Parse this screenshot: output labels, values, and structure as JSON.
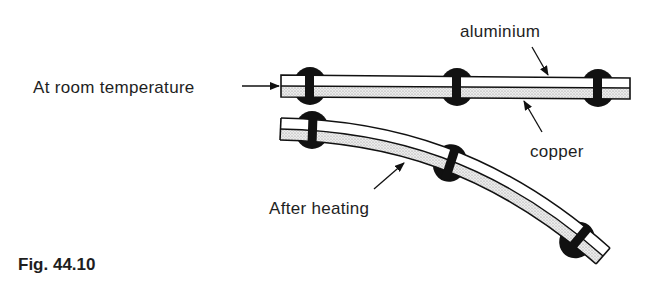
{
  "figure": {
    "caption": "Fig. 44.10",
    "labels": {
      "room_temperature": "At room temperature",
      "aluminium": "aluminium",
      "copper": "copper",
      "after_heating": "After heating"
    }
  },
  "diagram": {
    "states": [
      {
        "name": "At room temperature",
        "shape": "straight",
        "rivets": 3
      },
      {
        "name": "After heating",
        "shape": "bent downward",
        "rivets": 3
      }
    ],
    "layers": [
      {
        "material": "aluminium",
        "position": "top",
        "fill": "#ffffff"
      },
      {
        "material": "copper",
        "position": "bottom",
        "fill": "stippled grey"
      }
    ],
    "colors": {
      "ink": "#111111",
      "background": "#ffffff",
      "copper_fill": "#d9d9d9"
    }
  }
}
